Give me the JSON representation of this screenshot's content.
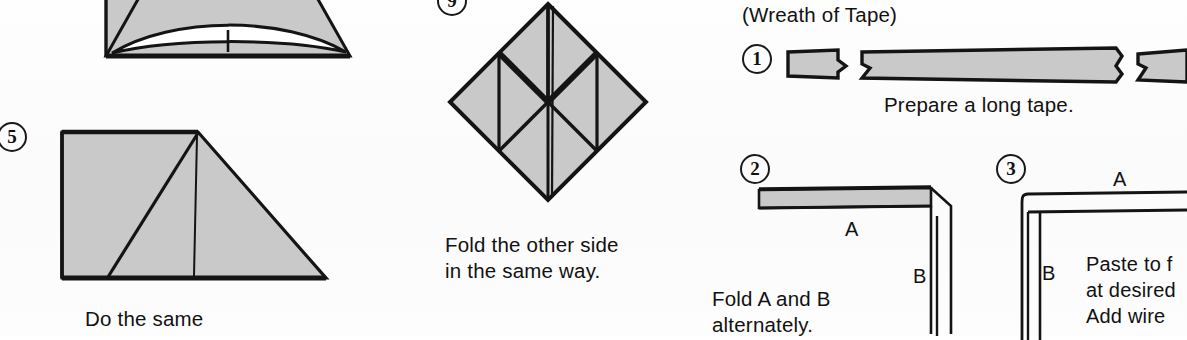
{
  "page": {
    "kind": "origami-instruction-scan",
    "paper_fill": "#c9c9c9",
    "ink": "#141414"
  },
  "panels": {
    "step4": {
      "step_label": "",
      "note": "cropped cone figure at top-left"
    },
    "step5": {
      "step_label": "5",
      "caption": "Do the same"
    },
    "step9": {
      "step_label": "9",
      "caption_line1": "Fold the other side",
      "caption_line2": "in the same way."
    },
    "wreath": {
      "heading": "(Wreath of Tape)",
      "step1": {
        "step_label": "1",
        "caption": "Prepare a long tape."
      },
      "step2": {
        "step_label": "2",
        "label_a": "A",
        "label_b": "B",
        "caption_line1": "Fold A and B",
        "caption_line2": "alternately."
      },
      "step3": {
        "step_label": "3",
        "label_a": "A",
        "label_b": "B",
        "caption_line1": "Paste to f",
        "caption_line2": "at desired",
        "caption_line3": "Add wire"
      }
    }
  }
}
